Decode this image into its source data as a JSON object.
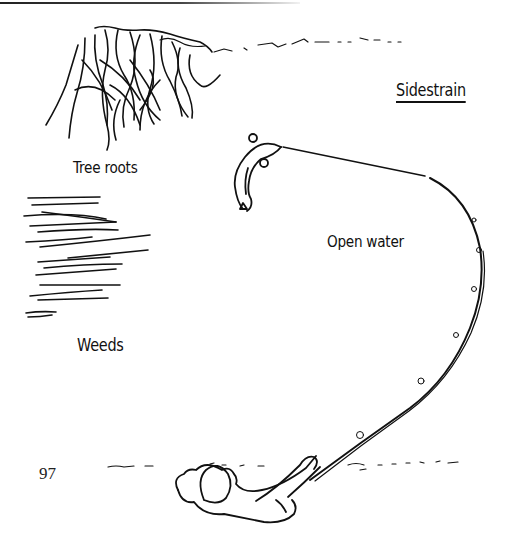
{
  "figure": {
    "title": "Sidestrain",
    "labels": {
      "tree_roots": "Tree roots",
      "weeds": "Weeds",
      "open_water": "Open water"
    },
    "elements": [
      "tree-roots",
      "weeds",
      "fish",
      "fishing-line",
      "fishing-rod",
      "angler",
      "bank-line"
    ]
  },
  "page": {
    "number": "97"
  },
  "colors": {
    "ink": "#111111",
    "paper": "#ffffff"
  }
}
